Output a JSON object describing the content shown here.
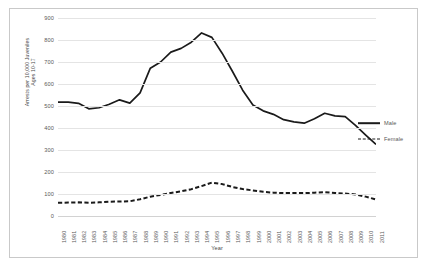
{
  "chart_data": {
    "type": "line",
    "title": "",
    "xlabel": "Year",
    "ylabel": "Arrests per 10,000 Juveniles Ages 10-17",
    "ylabel_lines": [
      "Arrests per 10,000 Juveniles",
      "Ages 10-17"
    ],
    "xlim": [
      1980,
      2011
    ],
    "ylim": [
      0,
      900
    ],
    "ytick_step": 100,
    "yticks": [
      0,
      100,
      200,
      300,
      400,
      500,
      600,
      700,
      800,
      900
    ],
    "grid": true,
    "legend_position": "right",
    "line_color": "#1a1a1a",
    "grid_color": "#e4e4e4",
    "categories": [
      "1980",
      "1981",
      "1982",
      "1983",
      "1984",
      "1985",
      "1986",
      "1987",
      "1988",
      "1989",
      "1990",
      "1991",
      "1992",
      "1993",
      "1994",
      "1995",
      "1996",
      "1997",
      "1998",
      "1999",
      "2000",
      "2001",
      "2002",
      "2003",
      "2004",
      "2005",
      "2006",
      "2007",
      "2008",
      "2009",
      "2010",
      "2011"
    ],
    "series": [
      {
        "name": "Male",
        "style": "solid",
        "values": [
          518,
          518,
          512,
          487,
          492,
          508,
          528,
          513,
          560,
          672,
          700,
          745,
          762,
          790,
          832,
          812,
          740,
          658,
          572,
          505,
          478,
          462,
          438,
          428,
          422,
          442,
          467,
          455,
          452,
          412,
          368,
          325
        ]
      },
      {
        "name": "Female",
        "style": "dashed",
        "values": [
          60,
          61,
          62,
          60,
          62,
          65,
          66,
          67,
          76,
          88,
          96,
          105,
          112,
          122,
          136,
          152,
          145,
          132,
          123,
          116,
          110,
          106,
          104,
          104,
          104,
          106,
          108,
          105,
          102,
          98,
          88,
          75
        ]
      }
    ]
  },
  "legend": {
    "entries": [
      {
        "label": "Male",
        "style": "solid"
      },
      {
        "label": "Female",
        "style": "dashed"
      }
    ]
  }
}
